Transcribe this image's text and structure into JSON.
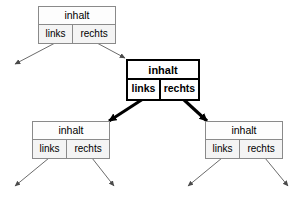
{
  "diagram": {
    "language": "de",
    "background_color": "#ffffff",
    "line_color": "#555555",
    "highlight_color": "#000000",
    "node_border_color": "#8a8a8a",
    "node_fill_color": "#fbfbfb",
    "labels": {
      "content": "inhalt",
      "left": "links",
      "right": "rechts"
    },
    "nodes": [
      {
        "id": "root",
        "role": "parent",
        "highlighted": false,
        "content": "inhalt",
        "left": "links",
        "right": "rechts"
      },
      {
        "id": "current",
        "role": "current",
        "highlighted": true,
        "content": "inhalt",
        "left": "links",
        "right": "rechts"
      },
      {
        "id": "child-left",
        "role": "child",
        "highlighted": false,
        "content": "inhalt",
        "left": "links",
        "right": "rechts"
      },
      {
        "id": "child-right",
        "role": "child",
        "highlighted": false,
        "content": "inhalt",
        "left": "links",
        "right": "rechts"
      }
    ],
    "edges": [
      {
        "id": "root-left-dangling",
        "from": "root",
        "from_cell": "links",
        "to": "null",
        "style": "thin"
      },
      {
        "id": "root-right-current",
        "from": "root",
        "from_cell": "rechts",
        "to": "current",
        "style": "thin"
      },
      {
        "id": "current-left-child",
        "from": "current",
        "from_cell": "links",
        "to": "child-left",
        "style": "thick"
      },
      {
        "id": "current-right-child",
        "from": "current",
        "from_cell": "rechts",
        "to": "child-right",
        "style": "thick"
      },
      {
        "id": "cl-left-dangling",
        "from": "child-left",
        "from_cell": "links",
        "to": "null",
        "style": "thin"
      },
      {
        "id": "cl-right-dangling",
        "from": "child-left",
        "from_cell": "rechts",
        "to": "null",
        "style": "thin"
      },
      {
        "id": "cr-left-dangling",
        "from": "child-right",
        "from_cell": "links",
        "to": "null",
        "style": "thin"
      },
      {
        "id": "cr-right-dangling",
        "from": "child-right",
        "from_cell": "rechts",
        "to": "null",
        "style": "thin"
      }
    ]
  }
}
